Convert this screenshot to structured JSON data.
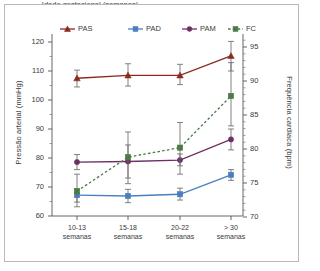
{
  "chart_data": {
    "type": "line",
    "title": "",
    "xlabel": "Idade gestacional (semanas)",
    "ylabel": "Pressão arterial (mmHg)",
    "ylabel_right": "Frequência cardíaca (bpm)",
    "categories": [
      "10-13 semanas",
      "15-18 semanas",
      "20-22 semanas",
      "> 30 semanas"
    ],
    "categories_line1": [
      "10-13",
      "15-18",
      "20-22",
      "> 30"
    ],
    "categories_line2": [
      "semanas",
      "semanas",
      "semanas",
      "semanas"
    ],
    "ylim": [
      60,
      124
    ],
    "yticks": [
      60,
      70,
      80,
      90,
      100,
      110,
      120
    ],
    "ylim_right": [
      70,
      97
    ],
    "yticks_right": [
      70,
      75,
      80,
      85,
      90,
      95
    ],
    "grid": false,
    "legend_position": "top",
    "series": [
      {
        "name": "PAS",
        "axis": "left",
        "color": "#8C2A22",
        "marker": "triangle",
        "linestyle": "solid",
        "values": [
          107.5,
          108.5,
          108.5,
          115.2
        ],
        "err_low": [
          104.5,
          104.8,
          105.3,
          110.0
        ],
        "err_high": [
          110.3,
          112.5,
          112.3,
          120.2
        ]
      },
      {
        "name": "PAD",
        "axis": "left",
        "color": "#4A7FBF",
        "marker": "square",
        "linestyle": "solid",
        "values": [
          67.2,
          66.9,
          67.5,
          74.2
        ],
        "err_low": [
          64.8,
          64.6,
          65.5,
          72.3
        ],
        "err_high": [
          69.3,
          69.2,
          69.6,
          76.0
        ]
      },
      {
        "name": "PAM",
        "axis": "left",
        "color": "#6B2F62",
        "marker": "circle",
        "linestyle": "solid",
        "values": [
          78.6,
          78.8,
          79.3,
          86.4
        ],
        "err_low": [
          76.0,
          73.1,
          77.3,
          82.8
        ],
        "err_high": [
          81.2,
          84.5,
          81.4,
          90.0
        ]
      },
      {
        "name": "FC",
        "axis": "right",
        "color": "#4B7A46",
        "marker": "square",
        "linestyle": "dashed",
        "values": [
          73.8,
          78.8,
          80.2,
          87.8
        ],
        "err_low": [
          71.5,
          74.9,
          76.3,
          83.4
        ],
        "err_high": [
          76.3,
          82.5,
          83.9,
          92.7
        ]
      }
    ]
  },
  "legend": {
    "items": [
      {
        "label": "PAS"
      },
      {
        "label": "PAD"
      },
      {
        "label": "PAM"
      },
      {
        "label": "FC"
      }
    ]
  }
}
